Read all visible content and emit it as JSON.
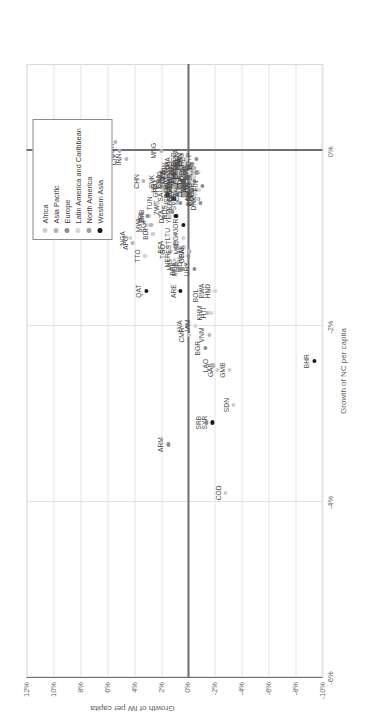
{
  "figure": {
    "x_axis_title": "Growth of NC per capita",
    "y_axis_title": "Growth of IW per capita"
  },
  "legend": {
    "title": "",
    "items": [
      {
        "label": "Africa",
        "color": "#cfcfcf"
      },
      {
        "label": "Asia Pacific",
        "color": "#b6b6b6"
      },
      {
        "label": "Europe",
        "color": "#8e8e8e"
      },
      {
        "label": "Latin America and Caribbean",
        "color": "#d6d6d6"
      },
      {
        "label": "North America",
        "color": "#9e9e9e"
      },
      {
        "label": "Western Asia",
        "color": "#1a1a1a"
      }
    ]
  },
  "chart_data": {
    "type": "scatter",
    "title": "",
    "xlabel": "Growth of NC per capita",
    "ylabel": "Growth of IW per capita",
    "xlim": [
      -6,
      1
    ],
    "ylim": [
      -10,
      12
    ],
    "xticks": [
      "-6%",
      "-4%",
      "-2%",
      "0%"
    ],
    "xtick_values": [
      -6,
      -4,
      -2,
      0
    ],
    "yticks": [
      "-10%",
      "-8%",
      "-6%",
      "-4%",
      "-2%",
      "0%",
      "2%",
      "4%",
      "6%",
      "8%",
      "10%",
      "12%"
    ],
    "ytick_values": [
      -10,
      -8,
      -6,
      -4,
      -2,
      0,
      2,
      4,
      6,
      8,
      10,
      12
    ],
    "grid": true,
    "legend_position": "top-right",
    "series": [
      {
        "name": "Western Asia",
        "color": "#1a1a1a",
        "points": [
          {
            "label": "IRQ",
            "x": -0.6,
            "y": 9.7
          },
          {
            "label": "KWT",
            "x": -0.7,
            "y": 5.9
          },
          {
            "label": "QAT",
            "x": -1.6,
            "y": 3.1
          },
          {
            "label": "ARE",
            "x": -1.6,
            "y": 0.55
          },
          {
            "label": "BHR",
            "x": -2.4,
            "y": -9.4
          },
          {
            "label": "SYR",
            "x": -3.1,
            "y": -1.8
          },
          {
            "label": "ISR",
            "x": -0.55,
            "y": 1.05
          },
          {
            "label": "YEM",
            "x": -0.75,
            "y": 0.9
          },
          {
            "label": "JOR",
            "x": -0.85,
            "y": 0.35
          },
          {
            "label": "SAU",
            "x": -0.5,
            "y": 1.5
          },
          {
            "label": "OMN",
            "x": -0.4,
            "y": 0.8
          },
          {
            "label": "LBN",
            "x": -0.5,
            "y": 0.5
          },
          {
            "label": "TUR",
            "x": -0.3,
            "y": 0.4
          }
        ]
      },
      {
        "name": "Africa",
        "color": "#cfcfcf",
        "points": [
          {
            "label": "LBR",
            "x": -0.95,
            "y": 6.8
          },
          {
            "label": "NGA",
            "x": -1.0,
            "y": 4.3
          },
          {
            "label": "CMR",
            "x": -2.1,
            "y": -0.1
          },
          {
            "label": "NER",
            "x": -1.25,
            "y": 1.0
          },
          {
            "label": "MLI",
            "x": -1.3,
            "y": 0.8
          },
          {
            "label": "TGO",
            "x": -1.15,
            "y": 1.3
          },
          {
            "label": "BFA",
            "x": -1.1,
            "y": 1.5
          },
          {
            "label": "MWI",
            "x": -0.85,
            "y": 3.1
          },
          {
            "label": "ZMB",
            "x": -0.75,
            "y": 2.9
          },
          {
            "label": "BDI",
            "x": -0.95,
            "y": 2.6
          },
          {
            "label": "ZWE",
            "x": -0.65,
            "y": 1.8
          },
          {
            "label": "DZA",
            "x": -0.75,
            "y": 1.4
          },
          {
            "label": "GAB",
            "x": -2.5,
            "y": -2.2
          },
          {
            "label": "GMB",
            "x": -2.5,
            "y": -3.1
          },
          {
            "label": "SDN",
            "x": -2.9,
            "y": -3.4
          },
          {
            "label": "COD",
            "x": -3.9,
            "y": -2.8
          },
          {
            "label": "BWA",
            "x": -1.6,
            "y": -1.6
          },
          {
            "label": "EGY",
            "x": -1.0,
            "y": 0.35
          },
          {
            "label": "MRT",
            "x": -1.1,
            "y": 0.3
          },
          {
            "label": "KEN",
            "x": -0.6,
            "y": 0.8
          },
          {
            "label": "SEN",
            "x": -0.5,
            "y": 0.65
          },
          {
            "label": "GHA",
            "x": -0.45,
            "y": 1.85
          },
          {
            "label": "MUS",
            "x": -0.25,
            "y": 0.6
          },
          {
            "label": "TUN",
            "x": -0.6,
            "y": 2.3
          },
          {
            "label": "CIV",
            "x": -0.1,
            "y": 5.0
          },
          {
            "label": "MAR",
            "x": -0.25,
            "y": 0.9
          },
          {
            "label": "ZAF",
            "x": -0.35,
            "y": 0.55
          },
          {
            "label": "TZA",
            "x": -0.3,
            "y": 0.4
          },
          {
            "label": "ETH",
            "x": -0.2,
            "y": 0.2
          },
          {
            "label": "UGA",
            "x": -0.15,
            "y": 0.1
          },
          {
            "label": "MOZ",
            "x": -0.4,
            "y": 0.0
          },
          {
            "label": "RWA",
            "x": -0.35,
            "y": -0.15
          },
          {
            "label": "NAM",
            "x": -0.45,
            "y": -0.3
          },
          {
            "label": "COG",
            "x": -0.3,
            "y": -0.45
          },
          {
            "label": "BEN",
            "x": -0.55,
            "y": -0.6
          },
          {
            "label": "NER2",
            "x": -0.25,
            "y": -0.75
          }
        ]
      },
      {
        "name": "Asia Pacific",
        "color": "#b6b6b6",
        "points": [
          {
            "label": "AFG",
            "x": -1.05,
            "y": 4.1
          },
          {
            "label": "IRN",
            "x": -0.1,
            "y": 4.6
          },
          {
            "label": "KOR",
            "x": 0.0,
            "y": 5.1
          },
          {
            "label": "KAZ",
            "x": 0.1,
            "y": 5.4
          },
          {
            "label": "SGP",
            "x": -0.85,
            "y": 2.75
          },
          {
            "label": "CHN",
            "x": -0.35,
            "y": 3.3
          },
          {
            "label": "PAK",
            "x": -1.15,
            "y": -0.1
          },
          {
            "label": "MDV",
            "x": -1.3,
            "y": 0.1
          },
          {
            "label": "LAO",
            "x": -2.45,
            "y": -1.85
          },
          {
            "label": "VNM",
            "x": -2.1,
            "y": -1.6
          },
          {
            "label": "KHM",
            "x": -1.85,
            "y": -1.45
          },
          {
            "label": "IND",
            "x": -0.3,
            "y": 1.55
          },
          {
            "label": "IDN",
            "x": -0.2,
            "y": 1.2
          },
          {
            "label": "THA",
            "x": -0.15,
            "y": 1.0
          },
          {
            "label": "MYS",
            "x": -0.2,
            "y": 0.85
          },
          {
            "label": "PHL",
            "x": -0.3,
            "y": 0.7
          },
          {
            "label": "BGD",
            "x": -0.1,
            "y": 0.55
          },
          {
            "label": "LKA",
            "x": -0.05,
            "y": 0.4
          },
          {
            "label": "NPL",
            "x": -0.15,
            "y": 0.25
          },
          {
            "label": "MNG",
            "x": 0.0,
            "y": 2.0
          },
          {
            "label": "JPN",
            "x": -0.1,
            "y": 0.1
          },
          {
            "label": "AUS",
            "x": -0.4,
            "y": -0.2
          },
          {
            "label": "NZL",
            "x": -0.25,
            "y": -0.35
          },
          {
            "label": "FJI",
            "x": -0.2,
            "y": -0.5
          },
          {
            "label": "PNG",
            "x": -0.45,
            "y": -0.65
          }
        ]
      },
      {
        "name": "Europe",
        "color": "#8e8e8e",
        "points": [
          {
            "label": "ARM",
            "x": -3.35,
            "y": 1.45
          },
          {
            "label": "SRB",
            "x": -3.1,
            "y": -1.35
          },
          {
            "label": "BGR",
            "x": -2.25,
            "y": -1.3
          },
          {
            "label": "LVA",
            "x": -2.0,
            "y": 0.05
          },
          {
            "label": "BEL",
            "x": -1.35,
            "y": 0.6
          },
          {
            "label": "EST",
            "x": -1.1,
            "y": 0.9
          },
          {
            "label": "LTU",
            "x": -0.95,
            "y": 0.95
          },
          {
            "label": "RUS",
            "x": -0.7,
            "y": 1.15
          },
          {
            "label": "ALB",
            "x": -0.05,
            "y": 6.0
          },
          {
            "label": "URY",
            "x": -1.35,
            "y": -0.45
          },
          {
            "label": "SVN",
            "x": -0.6,
            "y": 0.55
          },
          {
            "label": "MDA",
            "x": -1.35,
            "y": 0.45
          },
          {
            "label": "IRL",
            "x": -0.75,
            "y": 3.0
          },
          {
            "label": "SVK",
            "x": -0.35,
            "y": 2.15
          },
          {
            "label": "HRV",
            "x": -0.4,
            "y": 2.0
          },
          {
            "label": "CZE",
            "x": -0.3,
            "y": 1.35
          },
          {
            "label": "POL",
            "x": -0.25,
            "y": 1.25
          },
          {
            "label": "ROU",
            "x": -0.35,
            "y": 1.1
          },
          {
            "label": "HUN",
            "x": -0.45,
            "y": 0.95
          },
          {
            "label": "GRC",
            "x": -0.5,
            "y": 0.8
          },
          {
            "label": "PRT",
            "x": -0.4,
            "y": 0.65
          },
          {
            "label": "ESP",
            "x": -0.3,
            "y": 0.5
          },
          {
            "label": "ITA",
            "x": -0.2,
            "y": 0.35
          },
          {
            "label": "FRA",
            "x": -0.25,
            "y": 0.2
          },
          {
            "label": "DEU",
            "x": -0.3,
            "y": 0.05
          },
          {
            "label": "GBR",
            "x": -1.2,
            "y": -0.05
          },
          {
            "label": "NLD",
            "x": -0.2,
            "y": -0.2
          },
          {
            "label": "CHE",
            "x": -0.45,
            "y": -0.35
          },
          {
            "label": "AUT",
            "x": -0.35,
            "y": -0.5
          },
          {
            "label": "SWE",
            "x": -0.25,
            "y": -0.65
          },
          {
            "label": "NOR",
            "x": -0.55,
            "y": -0.8
          },
          {
            "label": "DNK",
            "x": -0.6,
            "y": -0.95
          },
          {
            "label": "FIN",
            "x": -0.4,
            "y": -1.1
          },
          {
            "label": "UKR",
            "x": -0.15,
            "y": -0.3
          },
          {
            "label": "CYP",
            "x": -0.1,
            "y": -0.6
          }
        ]
      },
      {
        "name": "Latin America and Caribbean",
        "color": "#d6d6d6",
        "points": [
          {
            "label": "VEN",
            "x": -0.05,
            "y": 6.4
          },
          {
            "label": "GUY",
            "x": 0.2,
            "y": 6.1
          },
          {
            "label": "TTO",
            "x": -1.2,
            "y": 3.2
          },
          {
            "label": "JAM",
            "x": -2.0,
            "y": -0.55
          },
          {
            "label": "HTI",
            "x": -1.85,
            "y": -1.7
          },
          {
            "label": "HND",
            "x": -1.6,
            "y": -2.0
          },
          {
            "label": "BOL",
            "x": -1.65,
            "y": -1.15
          },
          {
            "label": "BRA",
            "x": -0.35,
            "y": 1.6
          },
          {
            "label": "MEX",
            "x": -0.3,
            "y": 1.3
          },
          {
            "label": "ARG",
            "x": -0.45,
            "y": 1.05
          },
          {
            "label": "CHL",
            "x": -0.35,
            "y": 0.85
          },
          {
            "label": "COL",
            "x": -0.25,
            "y": 0.7
          },
          {
            "label": "PER",
            "x": -0.2,
            "y": 0.55
          },
          {
            "label": "ECU",
            "x": -0.3,
            "y": 0.4
          },
          {
            "label": "CRI",
            "x": -0.15,
            "y": 0.25
          },
          {
            "label": "PAN",
            "x": -0.1,
            "y": 0.1
          },
          {
            "label": "DOM",
            "x": -0.25,
            "y": -0.1
          },
          {
            "label": "GTM",
            "x": -0.4,
            "y": -0.25
          },
          {
            "label": "SLV",
            "x": -0.3,
            "y": -0.4
          },
          {
            "label": "NIC",
            "x": -0.5,
            "y": -0.55
          },
          {
            "label": "PRY",
            "x": -0.55,
            "y": -0.7
          },
          {
            "label": "CUB",
            "x": -0.45,
            "y": -0.85
          }
        ]
      },
      {
        "name": "North America",
        "color": "#9e9e9e",
        "points": [
          {
            "label": "USA",
            "x": -0.4,
            "y": 0.95
          },
          {
            "label": "CAN",
            "x": -0.5,
            "y": 0.3
          }
        ]
      }
    ]
  }
}
